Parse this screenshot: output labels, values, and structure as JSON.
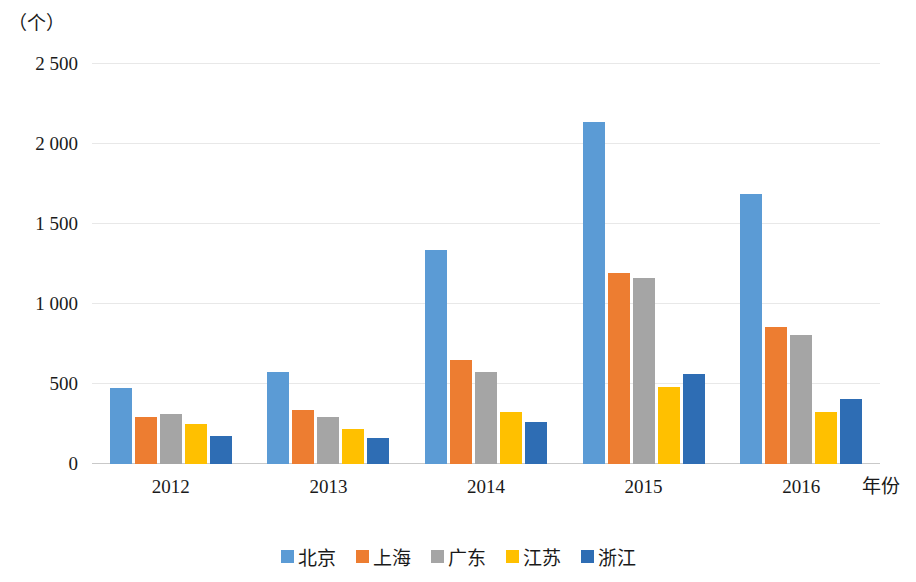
{
  "chart_data": {
    "type": "bar",
    "title": "",
    "subtitle": "",
    "xlabel": "年份",
    "ylabel": "（个）",
    "categories": [
      "2012",
      "2013",
      "2014",
      "2015",
      "2016"
    ],
    "series": [
      {
        "name": "北京",
        "color": "#5B9BD5",
        "values": [
          478,
          578,
          1340,
          2135,
          1690
        ]
      },
      {
        "name": "上海",
        "color": "#ED7D31",
        "values": [
          295,
          340,
          650,
          1195,
          855
        ]
      },
      {
        "name": "广东",
        "color": "#A5A5A5",
        "values": [
          315,
          295,
          575,
          1160,
          805
        ]
      },
      {
        "name": "江苏",
        "color": "#FFC000",
        "values": [
          250,
          220,
          325,
          480,
          325
        ]
      },
      {
        "name": "浙江",
        "color": "#2E6DB4",
        "values": [
          175,
          165,
          265,
          565,
          405
        ]
      }
    ],
    "ylim": [
      0,
      2500
    ],
    "yticks": [
      0,
      500,
      1000,
      1500,
      2000,
      2500
    ],
    "ytick_labels": [
      "0",
      "500",
      "1 000",
      "1 500",
      "2 000",
      "2 500"
    ],
    "grid": true,
    "legend_position": "bottom",
    "annotations": []
  }
}
